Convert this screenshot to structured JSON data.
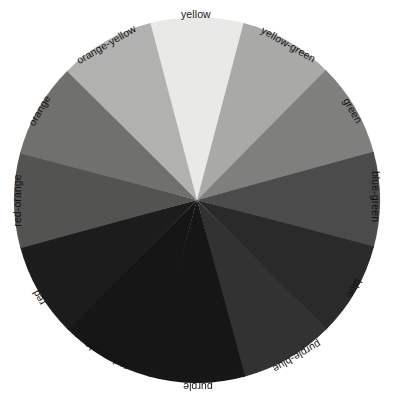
{
  "figure": {
    "background_color": "#ffffff",
    "label_color": "#111111",
    "center_x": 197,
    "center_y": 200,
    "radius": 183
  },
  "chart_data": {
    "type": "pie",
    "title": "",
    "subtitle": "",
    "xlabel": "",
    "ylabel": "",
    "legend_position": "none",
    "grid": false,
    "note": "Twelve-hue color wheel reproduced in grayscale; each wedge is an equal 30-degree slice labeled with its hue name placed tangentially outside the rim.",
    "slice_angle_degrees": 30,
    "categories": [
      "yellow",
      "yellow-green",
      "green",
      "blue-green",
      "blue",
      "purple-blue",
      "purple",
      "red-purple",
      "red",
      "red-orange",
      "orange",
      "orange-yellow"
    ],
    "values": [
      30,
      30,
      30,
      30,
      30,
      30,
      30,
      30,
      30,
      30,
      30,
      30
    ],
    "colors": [
      "#e9e9e7",
      "#a9a9a7",
      "#7f7f7d",
      "#4c4c4b",
      "#2a2a2a",
      "#303030",
      "#121212",
      "#181818",
      "#1d1d1d",
      "#525251",
      "#6f6f6d",
      "#b1b1af"
    ],
    "slices": [
      {
        "label": "yellow",
        "color": "#e9e9e7",
        "start_angle": -15,
        "end_angle": 15,
        "mid_angle": 0,
        "gray_value": 233
      },
      {
        "label": "yellow-green",
        "color": "#a9a9a7",
        "start_angle": 15,
        "end_angle": 45,
        "mid_angle": 30,
        "gray_value": 169
      },
      {
        "label": "green",
        "color": "#7f7f7d",
        "start_angle": 45,
        "end_angle": 75,
        "mid_angle": 60,
        "gray_value": 127
      },
      {
        "label": "blue-green",
        "color": "#4c4c4b",
        "start_angle": 75,
        "end_angle": 105,
        "mid_angle": 90,
        "gray_value": 76
      },
      {
        "label": "blue",
        "color": "#2a2a2a",
        "start_angle": 105,
        "end_angle": 135,
        "mid_angle": 120,
        "gray_value": 42
      },
      {
        "label": "purple-blue",
        "color": "#303030",
        "start_angle": 135,
        "end_angle": 165,
        "mid_angle": 150,
        "gray_value": 48
      },
      {
        "label": "purple",
        "color": "#121212",
        "start_angle": 165,
        "end_angle": 195,
        "mid_angle": 180,
        "gray_value": 18
      },
      {
        "label": "red-purple",
        "color": "#181818",
        "start_angle": 195,
        "end_angle": 225,
        "mid_angle": 210,
        "gray_value": 24
      },
      {
        "label": "red",
        "color": "#1d1d1d",
        "start_angle": 225,
        "end_angle": 255,
        "mid_angle": 240,
        "gray_value": 29
      },
      {
        "label": "red-orange",
        "color": "#525251",
        "start_angle": 255,
        "end_angle": 285,
        "mid_angle": 270,
        "gray_value": 82
      },
      {
        "label": "orange",
        "color": "#6f6f6d",
        "start_angle": 285,
        "end_angle": 315,
        "mid_angle": 300,
        "gray_value": 111
      },
      {
        "label": "orange-yellow",
        "color": "#b1b1af",
        "start_angle": 315,
        "end_angle": 345,
        "mid_angle": 330,
        "gray_value": 177
      }
    ]
  },
  "labels": [
    {
      "text": "yellow",
      "x": 196,
      "y": 14,
      "rotation": 0
    },
    {
      "text": "yellow-green",
      "x": 288,
      "y": 44,
      "rotation": 30
    },
    {
      "text": "green",
      "x": 352,
      "y": 110,
      "rotation": 60
    },
    {
      "text": "blue-green",
      "x": 375,
      "y": 196,
      "rotation": 90
    },
    {
      "text": "blue",
      "x": 354,
      "y": 288,
      "rotation": 120
    },
    {
      "text": "purple-blue",
      "x": 297,
      "y": 356,
      "rotation": 150
    },
    {
      "text": "purple",
      "x": 198,
      "y": 386,
      "rotation": 180
    },
    {
      "text": "red-purple",
      "x": 106,
      "y": 355,
      "rotation": 210
    },
    {
      "text": "red",
      "x": 38,
      "y": 297,
      "rotation": 240
    },
    {
      "text": "red-orange",
      "x": 17,
      "y": 200,
      "rotation": 270
    },
    {
      "text": "orange",
      "x": 39,
      "y": 110,
      "rotation": 300
    },
    {
      "text": "orange-yellow",
      "x": 106,
      "y": 44,
      "rotation": 330
    }
  ]
}
